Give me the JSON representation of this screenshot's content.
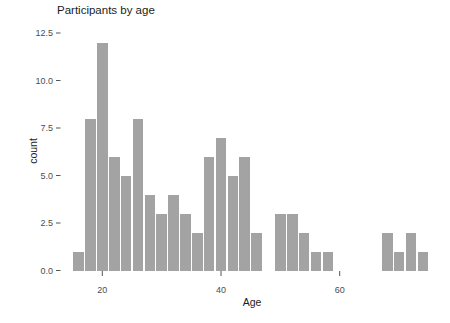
{
  "window": {
    "width": 450,
    "height": 323,
    "background": "#ffffff"
  },
  "chart": {
    "title": "Participants by age",
    "x_axis_label": "Age",
    "y_axis_label": "count",
    "colors": {
      "bar_fill": "#a3a3a3",
      "tick_mark": "#555555",
      "tick_label": "#4d4d4d",
      "axis_title": "#1c1c1c",
      "background": "#ffffff"
    }
  },
  "chart_data": {
    "type": "bar",
    "subtype": "histogram",
    "title": "Participants by age",
    "xlabel": "Age",
    "ylabel": "count",
    "bin_width": 2,
    "bins": [
      {
        "x": 16,
        "count": 1
      },
      {
        "x": 18,
        "count": 8
      },
      {
        "x": 20,
        "count": 12
      },
      {
        "x": 22,
        "count": 6
      },
      {
        "x": 24,
        "count": 5
      },
      {
        "x": 26,
        "count": 8
      },
      {
        "x": 28,
        "count": 4
      },
      {
        "x": 30,
        "count": 3
      },
      {
        "x": 32,
        "count": 4
      },
      {
        "x": 34,
        "count": 3
      },
      {
        "x": 36,
        "count": 2
      },
      {
        "x": 38,
        "count": 6
      },
      {
        "x": 40,
        "count": 7
      },
      {
        "x": 42,
        "count": 5
      },
      {
        "x": 44,
        "count": 6
      },
      {
        "x": 46,
        "count": 2
      },
      {
        "x": 50,
        "count": 3
      },
      {
        "x": 52,
        "count": 3
      },
      {
        "x": 54,
        "count": 2
      },
      {
        "x": 56,
        "count": 1
      },
      {
        "x": 58,
        "count": 1
      },
      {
        "x": 68,
        "count": 2
      },
      {
        "x": 70,
        "count": 1
      },
      {
        "x": 72,
        "count": 2
      },
      {
        "x": 74,
        "count": 1
      }
    ],
    "x_ticks": [
      {
        "value": 20,
        "label": "20"
      },
      {
        "value": 40,
        "label": "40"
      },
      {
        "value": 60,
        "label": "60"
      }
    ],
    "y_ticks": [
      {
        "value": 0,
        "label": "0.0"
      },
      {
        "value": 2.5,
        "label": "2.5"
      },
      {
        "value": 5,
        "label": "5.0"
      },
      {
        "value": 7.5,
        "label": "7.5"
      },
      {
        "value": 10,
        "label": "10.0"
      },
      {
        "value": 12.5,
        "label": "12.5"
      }
    ],
    "xlim": [
      13,
      77.5
    ],
    "ylim": [
      0,
      12.6
    ],
    "grid": false,
    "legend": null
  }
}
